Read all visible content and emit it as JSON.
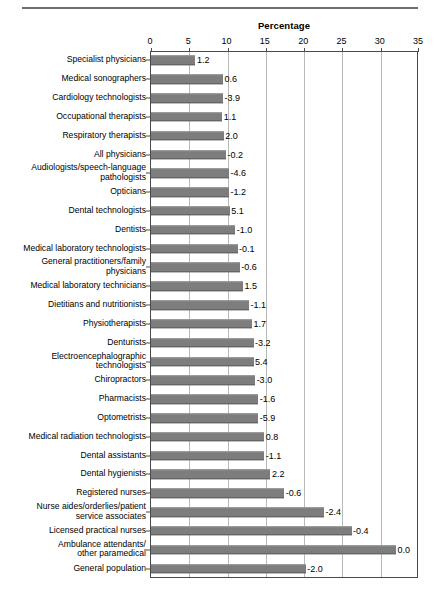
{
  "chart_data": {
    "type": "bar",
    "orientation": "horizontal",
    "title": "",
    "xlabel": "Percentage",
    "ylabel": "",
    "xlim": [
      0,
      35
    ],
    "xticks": [
      0,
      5,
      10,
      15,
      20,
      25,
      30,
      35
    ],
    "grid": true,
    "legend": null,
    "bar_color": "#7d7d7d",
    "categories": [
      "Specialist physicians",
      "Medical sonographers",
      "Cardiology technologists",
      "Occupational therapists",
      "Respiratory therapists",
      "All physicians",
      "Audiologists/speech-language\npathologists",
      "Opticians",
      "Dental technologists",
      "Dentists",
      "Medical laboratory technologists",
      "General practitioners/family\nphysicians",
      "Medical laboratory technicians",
      "Dietitians and nutritionists",
      "Physiotherapists",
      "Denturists",
      "Electroencephalographic\ntechnologists",
      "Chiropractors",
      "Pharmacists",
      "Optometrists",
      "Medical radiation technologists",
      "Dental assistants",
      "Dental hygienists",
      "Registered nurses",
      "Nurse aides/orderlies/patient\nservice associates",
      "Licensed practical nurses",
      "Ambulance attendants/\nother paramedical",
      "General population"
    ],
    "values": [
      5.8,
      9.4,
      9.4,
      9.3,
      9.5,
      9.8,
      10.2,
      10.2,
      10.3,
      11.0,
      11.3,
      11.6,
      12.0,
      12.8,
      13.2,
      13.4,
      13.4,
      13.6,
      14.0,
      14.0,
      14.8,
      14.8,
      15.6,
      17.4,
      22.6,
      26.2,
      32.0,
      20.2
    ],
    "data_labels": [
      "1.2",
      "0.6",
      "-3.9",
      "1.1",
      "2.0",
      "-0.2",
      "-4.6",
      "-1.2",
      "5.1",
      "-1.0",
      "-0.1",
      "-0.6",
      "1.5",
      "-1.1",
      "1.7",
      "-3.2",
      "5.4",
      "-3.0",
      "-1.6",
      "-5.9",
      "0.8",
      "-1.1",
      "2.2",
      "-0.6",
      "-2.4",
      "-0.4",
      "0.0",
      "-2.0"
    ]
  }
}
